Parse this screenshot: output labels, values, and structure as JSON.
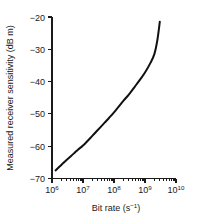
{
  "chart_data": {
    "type": "line",
    "title": "",
    "xlabel": "Bit rate (s−1)",
    "xlabel_base": "Bit rate (s",
    "xlabel_exponent": "−1",
    "xlabel_close": ")",
    "ylabel": "Measured receiver sensitivity (dB m)",
    "xscale": "log",
    "yscale": "linear",
    "xlim": [
      1000000,
      10000000000
    ],
    "ylim": [
      -70,
      -20
    ],
    "grid": false,
    "legend": null,
    "x_tick_labels": [
      "10⁶",
      "10⁷",
      "10⁸",
      "10⁹",
      "10¹⁰"
    ],
    "x_tick_bases": [
      "10",
      "10",
      "10",
      "10",
      "10"
    ],
    "x_tick_exponents": [
      "6",
      "7",
      "8",
      "9",
      "10"
    ],
    "x_tick_values": [
      1000000,
      10000000,
      100000000,
      1000000000,
      10000000000
    ],
    "y_tick_labels": [
      "−20",
      "−30",
      "−40",
      "−50",
      "−60",
      "−70"
    ],
    "y_tick_values": [
      -20,
      -30,
      -40,
      -50,
      -60,
      -70
    ],
    "minor_ticks": "log decades 2-9",
    "series": [
      {
        "name": "Measured receiver sensitivity",
        "color": "#111111",
        "x": [
          1300000,
          2000000,
          3000000,
          5000000,
          7000000,
          10000000,
          20000000,
          30000000,
          50000000,
          70000000,
          100000000,
          200000000,
          300000000,
          500000000,
          700000000,
          1000000000,
          1500000000,
          2000000000,
          2500000000,
          3000000000
        ],
        "y": [
          -67.5,
          -65.8,
          -64.2,
          -62.3,
          -61.0,
          -59.8,
          -56.8,
          -55.0,
          -52.7,
          -51.2,
          -49.5,
          -46.0,
          -44.0,
          -41.2,
          -39.3,
          -37.2,
          -34.2,
          -31.5,
          -27.2,
          -21.5
        ]
      }
    ]
  }
}
